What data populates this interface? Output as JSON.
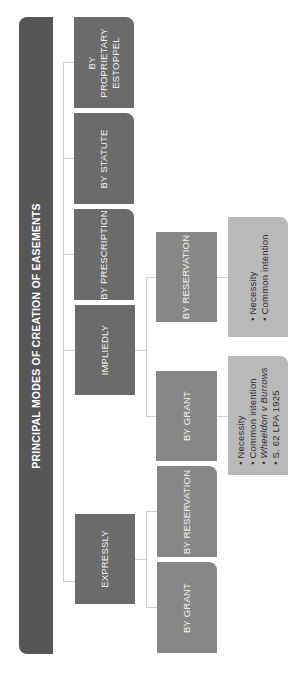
{
  "title": "PRINCIPAL MODES OF CREATION OF EASEMENTS",
  "level1": [
    {
      "label": "BY PROPRIETARY ESTOPPEL"
    },
    {
      "label": "BY STATUTE"
    },
    {
      "label": "BY PRESCRIPTION"
    },
    {
      "label": "IMPLIEDLY"
    },
    {
      "label": "EXPRESSLY"
    }
  ],
  "implied": {
    "by_reservation": {
      "label": "BY RESERVATION",
      "points": [
        "Necessity",
        "Common intention"
      ]
    },
    "by_grant": {
      "label": "BY GRANT",
      "points": [
        "Necessity",
        "Common intention",
        "Wheeldon v Burrows",
        "S. 62 LPA 1925"
      ]
    }
  },
  "express": {
    "by_reservation": {
      "label": "BY RESERVATION"
    },
    "by_grant": {
      "label": "BY GRANT"
    }
  },
  "colors": {
    "title": "#565656",
    "level1": "#6b6b6b",
    "level2": "#878787",
    "level3": "#b9b9b9",
    "connector": "#cfcfcf"
  }
}
